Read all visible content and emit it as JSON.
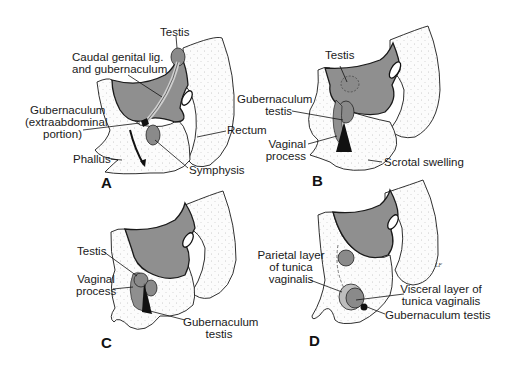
{
  "figure": {
    "colors": {
      "tissue_gray": "#8f8f8f",
      "outline": "#1a1a1a",
      "stipple_bg": "#fbfbfb",
      "background": "#ffffff"
    },
    "signature": "LF",
    "panels": [
      {
        "id": "A",
        "letter": "A",
        "labels": {
          "testis": "Testis",
          "caudal_line1": "Caudal genital lig.",
          "caudal_line2": "and gubernaculum",
          "gub_line1": "Gubernaculum",
          "gub_line2": "(extraabdominal",
          "gub_line3": "portion)",
          "rectum": "Rectum",
          "phallus": "Phallus",
          "symphysis": "Symphysis"
        }
      },
      {
        "id": "B",
        "letter": "B",
        "labels": {
          "testis": "Testis",
          "gub_line1": "Gubernaculum",
          "gub_line2": "testis",
          "vaginal_line1": "Vaginal",
          "vaginal_line2": "process",
          "scrotal": "Scrotal swelling"
        }
      },
      {
        "id": "C",
        "letter": "C",
        "labels": {
          "testis": "Testis",
          "vaginal_line1": "Vaginal",
          "vaginal_line2": "process",
          "gub_line1": "Gubernaculum",
          "gub_line2": "testis"
        }
      },
      {
        "id": "D",
        "letter": "D",
        "labels": {
          "parietal_line1": "Parietal layer",
          "parietal_line2": "of tunica",
          "parietal_line3": "vaginalis",
          "visceral_line1": "Visceral layer of",
          "visceral_line2": "tunica vaginalis",
          "gub": "Gubernaculum testis"
        }
      }
    ]
  }
}
